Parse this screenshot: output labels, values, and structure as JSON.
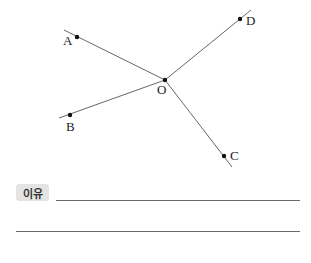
{
  "diagram": {
    "type": "rays from common point",
    "center": {
      "label": "O",
      "x": 165,
      "y": 80
    },
    "points": [
      {
        "label": "A",
        "x": 77,
        "y": 37
      },
      {
        "label": "B",
        "x": 70,
        "y": 115
      },
      {
        "label": "C",
        "x": 224,
        "y": 156
      },
      {
        "label": "D",
        "x": 240,
        "y": 19
      }
    ],
    "lines": [
      {
        "name": "OA",
        "x1": 165,
        "y1": 80,
        "x2": 64,
        "y2": 30
      },
      {
        "name": "OB",
        "x1": 165,
        "y1": 80,
        "x2": 59,
        "y2": 118
      },
      {
        "name": "OC",
        "x1": 165,
        "y1": 80,
        "x2": 232,
        "y2": 167
      },
      {
        "name": "OD",
        "x1": 165,
        "y1": 80,
        "x2": 251,
        "y2": 10
      }
    ],
    "line_color": "#555555"
  },
  "answer": {
    "badge_label": "이유",
    "lines_count": 2
  }
}
